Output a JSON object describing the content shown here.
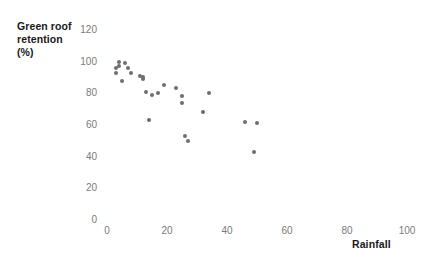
{
  "chart_data": {
    "type": "scatter",
    "title": "",
    "xlabel": "Rainfall",
    "ylabel": "Green roof retention (%)",
    "ylabel_lines": "Green roof\nretention\n(%)",
    "xlim": [
      0,
      100
    ],
    "ylim": [
      0,
      120
    ],
    "xticks": [
      "0",
      "20",
      "40",
      "60",
      "80",
      "100"
    ],
    "yticks": [
      "0",
      "20",
      "40",
      "60",
      "80",
      "100",
      "120"
    ],
    "grid": false,
    "legend": null,
    "marker_color": "#6e6e6e",
    "tick_color": "#7a7a7a",
    "label_color": "#1a1a1a",
    "x": [
      3,
      3,
      4,
      4,
      5,
      6,
      7,
      8,
      11,
      12,
      12,
      13,
      14,
      15,
      17,
      19,
      23,
      25,
      25,
      26,
      27,
      32,
      34,
      46,
      49,
      50
    ],
    "y": [
      96,
      93,
      100,
      97,
      88,
      99,
      96,
      93,
      91,
      90,
      89,
      81,
      63,
      79,
      80,
      85,
      83,
      78,
      74,
      53,
      50,
      68,
      80,
      62,
      43,
      61
    ],
    "points": [
      {
        "x": 3,
        "y": 96
      },
      {
        "x": 3,
        "y": 93
      },
      {
        "x": 4,
        "y": 100
      },
      {
        "x": 4,
        "y": 97
      },
      {
        "x": 5,
        "y": 88
      },
      {
        "x": 6,
        "y": 99
      },
      {
        "x": 7,
        "y": 96
      },
      {
        "x": 8,
        "y": 93
      },
      {
        "x": 11,
        "y": 91
      },
      {
        "x": 12,
        "y": 90
      },
      {
        "x": 12,
        "y": 89
      },
      {
        "x": 13,
        "y": 81
      },
      {
        "x": 14,
        "y": 63
      },
      {
        "x": 15,
        "y": 79
      },
      {
        "x": 17,
        "y": 80
      },
      {
        "x": 19,
        "y": 85
      },
      {
        "x": 23,
        "y": 83
      },
      {
        "x": 25,
        "y": 78
      },
      {
        "x": 25,
        "y": 74
      },
      {
        "x": 26,
        "y": 53
      },
      {
        "x": 27,
        "y": 50
      },
      {
        "x": 32,
        "y": 68
      },
      {
        "x": 34,
        "y": 80
      },
      {
        "x": 46,
        "y": 62
      },
      {
        "x": 49,
        "y": 43
      },
      {
        "x": 50,
        "y": 61
      }
    ]
  },
  "axes": {
    "x_title": "Rainfall",
    "y_title": "Green roof\nretention\n(%)"
  }
}
